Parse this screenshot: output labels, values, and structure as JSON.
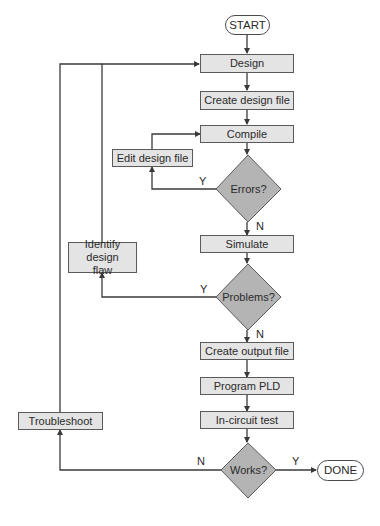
{
  "flowchart": {
    "start": "START",
    "end": "DONE",
    "process": {
      "design": "Design",
      "create_design_file": "Create design file",
      "compile": "Compile",
      "edit_design_file": "Edit design file",
      "simulate": "Simulate",
      "identify_design_flaw": "Identify design flaw",
      "create_output_file": "Create output file",
      "program_pld": "Program PLD",
      "in_circuit_test": "In-circuit test",
      "troubleshoot": "Troubleshoot"
    },
    "decisions": {
      "errors": "Errors?",
      "problems": "Problems?",
      "works": "Works?"
    },
    "branch_labels": {
      "errors_yes": "Y",
      "errors_no": "N",
      "problems_yes": "Y",
      "problems_no": "N",
      "works_yes": "Y",
      "works_no": "N"
    },
    "colors": {
      "box_fill": "#e4e4e4",
      "decision_fill": "#b4b4b4",
      "line": "#3a3a3a"
    }
  }
}
